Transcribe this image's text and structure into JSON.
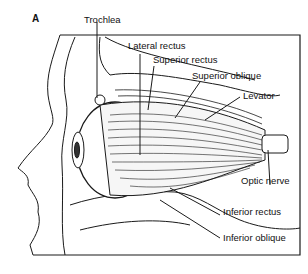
{
  "figure": {
    "panel_letter": "A",
    "labels": {
      "trochlea": "Trochlea",
      "lateral_rectus": "Lateral rectus",
      "superior_rectus": "Superior rectus",
      "superior_oblique": "Superior oblique",
      "levator": "Levator",
      "optic_nerve": "Optic nerve",
      "inferior_rectus": "Inferior rectus",
      "inferior_oblique": "Inferior oblique"
    },
    "colors": {
      "line": "#1a1a1a",
      "background": "#ffffff",
      "muscle_fill": "#f4f4f4"
    }
  }
}
